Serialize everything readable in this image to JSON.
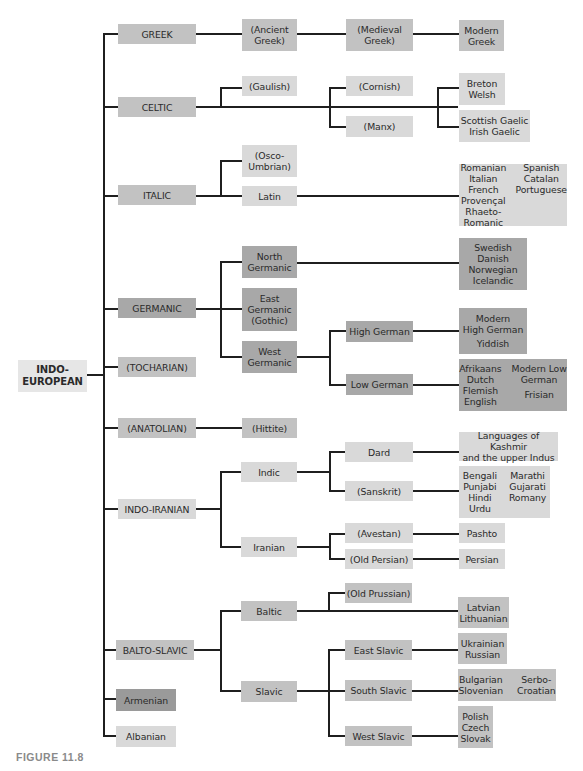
{
  "figure_caption": "FIGURE 11.8",
  "colors": {
    "light": "#d9d9d9",
    "mid": "#c2c2c2",
    "dark": "#a8a8a8",
    "root": "#e6e6e6",
    "line": "#1f1f1f"
  },
  "root": {
    "label": "INDO-\nEUROPEAN",
    "lines": [
      "INDO-",
      "EUROPEAN"
    ]
  },
  "branches": {
    "greek": {
      "label": "GREEK",
      "ancient": [
        "(Ancient",
        "Greek)"
      ],
      "medieval": [
        "(Medieval",
        "Greek)"
      ],
      "modern": [
        "Modern",
        "Greek"
      ]
    },
    "celtic": {
      "label": "CELTIC",
      "gaulish": "(Gaulish)",
      "cornish": "(Cornish)",
      "manx": "(Manx)",
      "brythonic": [
        "Breton",
        "Welsh"
      ],
      "goidelic": [
        "Scottish Gaelic",
        "Irish Gaelic"
      ]
    },
    "italic": {
      "label": "ITALIC",
      "osco": [
        "(Osco-",
        "Umbrian)"
      ],
      "latin": "Latin",
      "romance_col1": [
        "Romanian",
        "Italian",
        "French",
        "Provençal",
        "Rhaeto-Romanic"
      ],
      "romance_col2": [
        "Spanish",
        "Catalan",
        "Portuguese"
      ]
    },
    "germanic": {
      "label": "GERMANIC",
      "north": [
        "North",
        "Germanic"
      ],
      "east": [
        "East",
        "Germanic",
        "(Gothic)"
      ],
      "west": [
        "West",
        "Germanic"
      ],
      "north_leaves": [
        "Swedish",
        "Danish",
        "Norwegian",
        "Icelandic"
      ],
      "high_german": "High German",
      "low_german": "Low German",
      "high_leaves": [
        "Modern",
        "High German",
        "Yiddish"
      ],
      "low_col1": [
        "Afrikaans",
        "Dutch",
        "Flemish",
        "English"
      ],
      "low_col2": [
        "Modern Low",
        "German",
        "Frisian"
      ]
    },
    "tocharian": {
      "label": "(TOCHARIAN)"
    },
    "anatolian": {
      "label": "(ANATOLIAN)",
      "hittite": "(Hittite)"
    },
    "indo_iranian": {
      "label": "INDO-IRANIAN",
      "indic": "Indic",
      "iranian": "Iranian",
      "dard": "Dard",
      "sanskrit": "(Sanskrit)",
      "dard_leaves": [
        "Languages of Kashmir",
        "and the upper Indus"
      ],
      "sanskrit_col1": [
        "Bengali",
        "Punjabi",
        "Hindi",
        "Urdu"
      ],
      "sanskrit_col2": [
        "Marathi",
        "Gujarati",
        "Romany"
      ],
      "avestan": "(Avestan)",
      "old_persian": "(Old Persian)",
      "pashto": "Pashto",
      "persian": "Persian"
    },
    "balto_slavic": {
      "label": "BALTO-SLAVIC",
      "baltic": "Baltic",
      "slavic": "Slavic",
      "old_prussian": "(Old Prussian)",
      "baltic_leaves": [
        "Latvian",
        "Lithuanian"
      ],
      "east_slavic": "East Slavic",
      "south_slavic": "South Slavic",
      "west_slavic": "West Slavic",
      "east_leaves": [
        "Ukrainian",
        "Russian"
      ],
      "south_col1": [
        "Bulgarian",
        "Slovenian"
      ],
      "south_col2": [
        "Serbo-",
        "Croatian"
      ],
      "west_leaves": [
        "Polish",
        "Czech",
        "Slovak"
      ]
    },
    "armenian": {
      "label": "Armenian"
    },
    "albanian": {
      "label": "Albanian"
    }
  }
}
